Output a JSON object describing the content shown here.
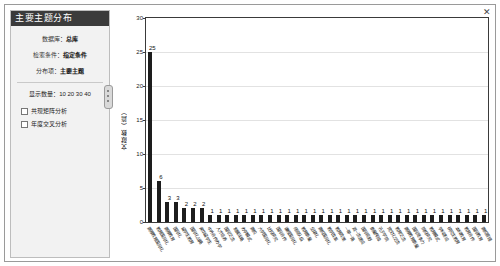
{
  "panel": {
    "title": "主要主题分布",
    "rows": [
      {
        "label": "数据库：",
        "value": "总库"
      },
      {
        "label": "检索条件：",
        "value": "指定条件"
      },
      {
        "label": "分布项：",
        "value": "主要主题"
      }
    ],
    "keywords_label": "显示数量：",
    "keywords_values": "10  20  30  40",
    "options": [
      {
        "label": "共现矩阵分析",
        "checked": false
      },
      {
        "label": "年度交叉分析",
        "checked": false
      }
    ],
    "close_icon": "✕"
  },
  "chart_data": {
    "type": "bar",
    "title": "",
    "xlabel": "",
    "ylabel": "文献数（篇）",
    "ylim": [
      0,
      30
    ],
    "yticks": [
      0,
      5,
      10,
      15,
      20,
      25,
      30
    ],
    "grid": true,
    "legend": "none",
    "categories": [
      "高等教育国际化",
      "教育国际化",
      "高等教育",
      "国际化",
      "留学生教育",
      "国际化战略",
      "来华留学生",
      "中外合作办学",
      "人才培养",
      "国际交流",
      "发展战略",
      "办学模式",
      "高校",
      "大学国际化",
      "比较研究",
      "国际合作",
      "课程国际化",
      "师资队伍",
      "教育质量",
      "全球化",
      "高校国际化",
      "教学改革",
      "教育政策",
      "一带一路",
      "双一流建设",
      "国际视野",
      "质量保障",
      "孔子学院",
      "跨文化交流",
      "教育交流",
      "高等教育质量",
      "国际竞争力",
      "院校研究",
      "教育模式",
      "学科建设",
      "研究生教育",
      "本科教育",
      "教育合作",
      "国际教育",
      "高校管理"
    ],
    "values": [
      25,
      6,
      3,
      3,
      2,
      2,
      2,
      1,
      1,
      1,
      1,
      1,
      1,
      1,
      1,
      1,
      1,
      1,
      1,
      1,
      1,
      1,
      1,
      1,
      1,
      1,
      1,
      1,
      1,
      1,
      1,
      1,
      1,
      1,
      1,
      1,
      1,
      1,
      1,
      1
    ]
  }
}
